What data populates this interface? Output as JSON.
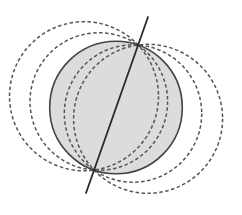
{
  "diagram": {
    "colors": {
      "background": "#ffffff",
      "fill": "#dcdcdc",
      "stroke": "#444444",
      "dashed_stroke": "#555555",
      "line": "#2a2a2a"
    },
    "points": [
      {
        "name": "P1",
        "x": 138,
        "y": 45
      },
      {
        "name": "P2",
        "x": 94,
        "y": 170
      }
    ],
    "line": {
      "x1": 148,
      "y1": 17,
      "x2": 86,
      "y2": 193
    },
    "solid_circle": {
      "cx": 116,
      "cy": 107.5,
      "r": 66.3
    },
    "dashed_circles": [
      {
        "cx": 84.0,
        "cy": 96.2,
        "r": 74.5
      },
      {
        "cx": 98.8,
        "cy": 101.5,
        "r": 68.8
      },
      {
        "cx": 133.0,
        "cy": 113.5,
        "r": 68.7
      },
      {
        "cx": 148.1,
        "cy": 118.8,
        "r": 74.5
      }
    ]
  }
}
